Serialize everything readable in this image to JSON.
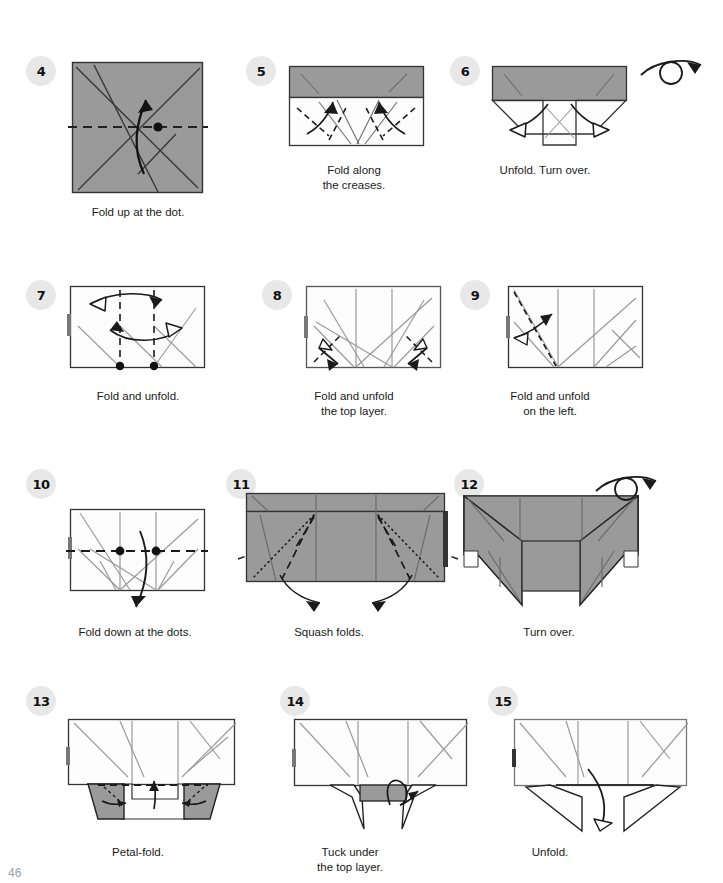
{
  "page": {
    "page_number": "46",
    "background_color": "#ffffff",
    "paper_gray": "#9a9a9a",
    "paper_white": "#fdfdfd",
    "line_color": "#1a1a1a",
    "crease_color": "#8c8c8c",
    "badge_bg": "#e8e8e8",
    "badge_text_color": "#111111"
  },
  "steps": [
    {
      "number": "4",
      "caption": "Fold up at the dot.",
      "shape": "square",
      "fill": "gray",
      "markers": [
        "dashed-horizontal-line",
        "dot",
        "curved-up-arrow",
        "crease-lines"
      ]
    },
    {
      "number": "5",
      "caption": "Fold along\nthe creases.",
      "shape": "rectangle",
      "fill": "gray-band-top-white-bottom",
      "markers": [
        "dashed-creases",
        "up-arrows",
        "crease-lines"
      ]
    },
    {
      "number": "6",
      "caption": "Unfold. Turn over.",
      "shape": "rectangle-with-flaps",
      "fill": "gray-top-white-flaps",
      "markers": [
        "outward-unfold-arrows",
        "turn-over-symbol"
      ]
    },
    {
      "number": "7",
      "caption": "Fold and unfold.",
      "shape": "rectangle",
      "fill": "white",
      "markers": [
        "vertical-dashed-lines",
        "two-dots",
        "double-headed-arrows",
        "left-tab"
      ]
    },
    {
      "number": "8",
      "caption": "Fold and unfold\nthe top layer.",
      "shape": "rectangle",
      "fill": "white",
      "markers": [
        "corner-double-arrows",
        "dashed-creases",
        "crease-lines",
        "left-tab"
      ]
    },
    {
      "number": "9",
      "caption": "Fold and unfold\non the left.",
      "shape": "rectangle",
      "fill": "white",
      "markers": [
        "left-diagonal-dashed-line",
        "double-headed-arrow",
        "crease-lines",
        "left-tab"
      ]
    },
    {
      "number": "10",
      "caption": "Fold down at the dots.",
      "shape": "rectangle",
      "fill": "white",
      "markers": [
        "dashed-horizontal-line",
        "two-dots",
        "curved-down-arrow",
        "crease-lines",
        "left-tab"
      ]
    },
    {
      "number": "11",
      "caption": "Squash folds.",
      "shape": "rectangle",
      "fill": "gray",
      "markers": [
        "dash-dot-fold-lines",
        "squash-arrows",
        "side-dashed-extensions"
      ]
    },
    {
      "number": "12",
      "caption": "Turn over.",
      "shape": "winged-form",
      "fill": "gray",
      "markers": [
        "triangular-wings",
        "turn-over-symbol",
        "crease-lines"
      ]
    },
    {
      "number": "13",
      "caption": "Petal-fold.",
      "shape": "rectangle-with-triangles",
      "fill": "white-with-gray-triangles",
      "markers": [
        "dashed-horizontal-line",
        "up-arrow",
        "gray-petal-triangles",
        "left-tab"
      ]
    },
    {
      "number": "14",
      "caption": "Tuck under\nthe top layer.",
      "shape": "rectangle-with-legs",
      "fill": "white-with-gray-tab",
      "markers": [
        "gray-center-tab",
        "tuck-arrow",
        "legs",
        "left-tab"
      ]
    },
    {
      "number": "15",
      "caption": "Unfold.",
      "shape": "rectangle-with-legs",
      "fill": "white",
      "markers": [
        "large-unfold-arrow",
        "legs",
        "crease-lines",
        "left-tab"
      ]
    }
  ]
}
